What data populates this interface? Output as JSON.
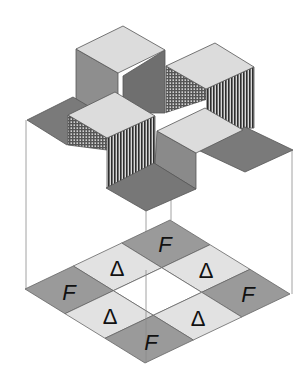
{
  "diagram": {
    "colors": {
      "background": "#ffffff",
      "light_face": "#dcdcdc",
      "medium_face": "#8c8c8c",
      "dark_face": "#7a7a7a",
      "floor_dark": "#9a9a9a",
      "floor_light": "#e2e2e2",
      "edge": "#555555",
      "guide_line": "#888888"
    },
    "floor_grid": {
      "rows": 3,
      "cols": 3,
      "cells": [
        {
          "row": 0,
          "col": 0,
          "label": "F",
          "shade": "dark"
        },
        {
          "row": 0,
          "col": 1,
          "label": "Δ",
          "shade": "light"
        },
        {
          "row": 0,
          "col": 2,
          "label": "F",
          "shade": "dark"
        },
        {
          "row": 1,
          "col": 0,
          "label": "Δ",
          "shade": "light"
        },
        {
          "row": 1,
          "col": 1,
          "label": "",
          "shade": "empty"
        },
        {
          "row": 1,
          "col": 2,
          "label": "Δ",
          "shade": "light"
        },
        {
          "row": 2,
          "col": 0,
          "label": "F",
          "shade": "dark"
        },
        {
          "row": 2,
          "col": 1,
          "label": "Δ",
          "shade": "light"
        },
        {
          "row": 2,
          "col": 2,
          "label": "F",
          "shade": "dark"
        }
      ]
    },
    "labels": {
      "f": "F",
      "delta": "Δ"
    }
  }
}
